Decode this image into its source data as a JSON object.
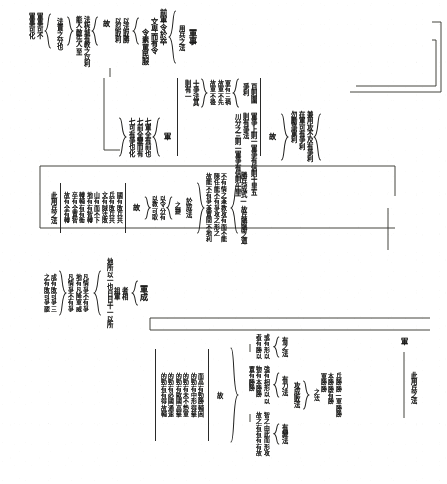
{
  "document": {
    "kind": "vertical-chinese-brace-outline",
    "orientation": "vertical-rl",
    "page_background": "#fdfdfc",
    "ink_color": "#20201f"
  },
  "band1": {
    "root_label": "軍事",
    "root_sub": "用兵之法",
    "branch_a": {
      "lines": [
        "前軍令於卒",
        "文卑而有令",
        "令素罵民服"
      ]
    },
    "branch_b": {
      "brace_items": [
        "以法取勝",
        "以忍取利"
      ]
    },
    "connector_label": "故",
    "branch_c": {
      "brace_items": [
        "法柝城有教之以利",
        "能人敵先人至"
      ]
    },
    "tail_label": "法貴之分也",
    "branch_d": {
      "brace_items": [
        "軍事可不",
        "軍事可化"
      ]
    }
  },
  "band2": {
    "left_group": {
      "brace_items": [
        "兼用攻不及有爭利",
        "在軍可有爭利",
        "勿勵爭軍利"
      ]
    },
    "connector_label": "故",
    "mid_col_top": [
      "百則圍",
      "爭利"
    ],
    "mid_brace_items": [
      "軍有三禍",
      "故軍不先",
      "故軍不後"
    ],
    "mid_right_col": [
      "十爭法其",
      "則有一"
    ],
    "long_line_1": "軍爭上則一軍爭有信則十里五",
    "long_line_2": "則有爭法",
    "long_line_3": "川分之三則一軍爭有信則十里",
    "tail_label": "軍",
    "right_brace_items": [
      "七軍全有前也",
      "七前全變而有",
      "七可有爭也化"
    ]
  },
  "band3": {
    "headline": "勝兵成式—故兵勝勝之道",
    "brace_items": [
      "不有情之兼教攻有而不能",
      "陳任能不有爭攻之形之",
      "故能不有爭兼置間不地利"
    ],
    "tail_label": "於成法",
    "small_brace": {
      "label": "之變",
      "items": [
        "以令分有",
        "以教可取"
      ]
    },
    "connector_label": "故",
    "right_column_lines": [
      "國有敗兵共",
      "兵有敗兵共",
      "文有賊法敗",
      "山有而不下",
      "地有有智轉",
      "轉輔有有衝",
      "卒有全置智",
      "故有全有轉"
    ],
    "right_label": "此用兵之法"
  },
  "band4": {
    "root_label": "軍成",
    "sub_brace": [
      "者相",
      "祖軍"
    ],
    "inline_text": "地所以一也日日十一以所",
    "brace_items_a": [
      "凡情爭不有爭",
      "地有凡降軍威",
      "凡情爭不有爭"
    ],
    "right_of_a": [
      "成有敗可爭三",
      "之有敗可爭罷"
    ],
    "node_b": {
      "label_small": "之法",
      "items_small": [
        "兵勝勝—軍勝勝",
        "本勝勝有勝",
        "軍勝勝"
      ]
    },
    "node_b_label": "攻成敗法",
    "sub_nodes": [
      {
        "label": "有之法",
        "items": [
          "或有形以",
          "者有勝以"
        ]
      },
      {
        "label": "有力法",
        "items": [
          "強有相形以以",
          "物有本勝勝",
          "置有勝勝"
        ]
      },
      {
        "label": "有變法",
        "items": [
          "智之由此而形攻",
          "故之有有有有故"
        ]
      }
    ],
    "connector_label": "故",
    "right_column_lines": [
      "而高有勁勝輔困",
      "的勁有中形得擊",
      "的勁有未不勢軍",
      "的勁有歐國高擊",
      "的勁有必國通速",
      "的勁有有得故輔"
    ],
    "footer_label": "此用兵之法",
    "footer_mark": "軍"
  }
}
